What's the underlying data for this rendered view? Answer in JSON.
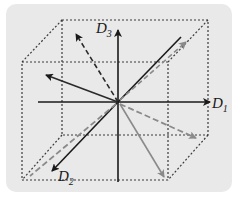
{
  "diagram": {
    "type": "3d-coordinate-vector-diagram",
    "axes": [
      {
        "name": "D1",
        "base": "D",
        "subscript": "1",
        "direction": "right"
      },
      {
        "name": "D2",
        "base": "D",
        "subscript": "2",
        "direction": "front-down-left"
      },
      {
        "name": "D3",
        "base": "D",
        "subscript": "3",
        "direction": "up"
      }
    ],
    "labels": {
      "d1_base": "D",
      "d1_sub": "1",
      "d2_base": "D",
      "d2_sub": "2",
      "d3_base": "D",
      "d3_sub": "3"
    },
    "colors": {
      "background": "#e9e9e9",
      "axis": "#1a1a1a",
      "dark_vector": "#2a2a2a",
      "gray_vector": "#8a8a8a",
      "cube_edge": "#3a3a3a"
    },
    "vectors": [
      {
        "id": "v1",
        "style": "solid",
        "color": "dark",
        "to": "upper-left"
      },
      {
        "id": "v2",
        "style": "dashed",
        "color": "dark",
        "to": "top-back-left"
      },
      {
        "id": "v3",
        "style": "solid",
        "color": "dark",
        "to": "upper-right-back"
      },
      {
        "id": "v4",
        "style": "dashed",
        "color": "gray",
        "to": "upper-right-back"
      },
      {
        "id": "v5",
        "style": "dashed",
        "color": "gray",
        "to": "right-lower"
      },
      {
        "id": "v6",
        "style": "solid",
        "color": "gray",
        "to": "bottom-front-right"
      },
      {
        "id": "v7",
        "style": "dashed",
        "color": "gray",
        "to": "bottom-front-left"
      }
    ],
    "cube": {
      "edges": "dotted"
    }
  }
}
